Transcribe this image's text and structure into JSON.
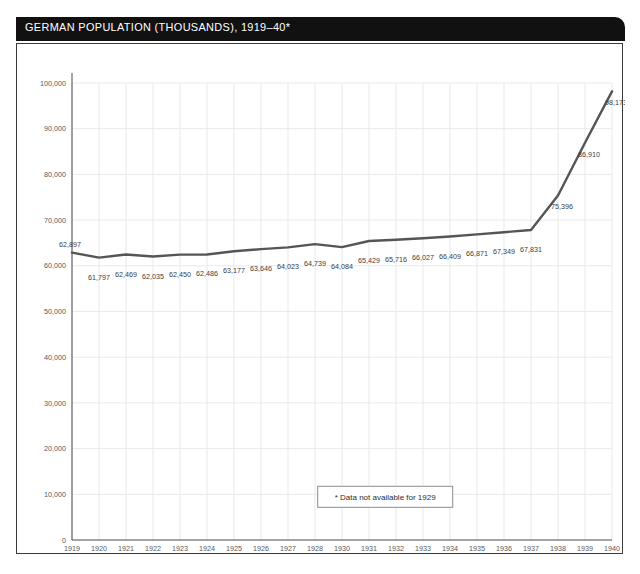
{
  "card": {
    "title": "GERMAN POPULATION (THOUSANDS), 1919–40*"
  },
  "footnote": {
    "text": "* Data not available for 1929"
  },
  "colors": {
    "title_bar_bg": "#111111",
    "title_text": "#ffffff",
    "series_line": "#555555",
    "grid": "#e9e9e9",
    "axis": "#4a4a4a",
    "label_text": "#3d3d3f",
    "tick_text": "#58585a"
  },
  "chart_data": {
    "type": "line",
    "title": "GERMAN POPULATION (THOUSANDS), 1919–40*",
    "xlabel": "",
    "ylabel": "",
    "ylim": [
      0,
      100000
    ],
    "y_ticks": [
      0,
      10000,
      20000,
      30000,
      40000,
      50000,
      60000,
      70000,
      80000,
      90000,
      100000
    ],
    "y_tick_labels": [
      "0",
      "10,000",
      "20,000",
      "30,000",
      "40,000",
      "50,000",
      "60,000",
      "70,000",
      "80,000",
      "90,000",
      "100,000"
    ],
    "grid": true,
    "legend": null,
    "categories": [
      "1919",
      "1920",
      "1921",
      "1922",
      "1923",
      "1924",
      "1925",
      "1926",
      "1927",
      "1928",
      "1930",
      "1931",
      "1932",
      "1933",
      "1934",
      "1935",
      "1936",
      "1937",
      "1938",
      "1939",
      "1940"
    ],
    "values": [
      62897,
      61797,
      62469,
      62035,
      62450,
      62486,
      63177,
      63646,
      64023,
      64739,
      64084,
      65429,
      65716,
      66027,
      66409,
      66871,
      67349,
      67831,
      75396,
      86910,
      98173
    ],
    "point_labels": [
      "62,897",
      "61,797",
      "62,469",
      "62,035",
      "62,450",
      "62,486",
      "63,177",
      "63,646",
      "64,023",
      "64,739",
      "64,084",
      "65,429",
      "65,716",
      "66,027",
      "66,409",
      "66,871",
      "67,349",
      "67,831",
      "75,396",
      "86,910",
      "98,173"
    ],
    "annotations": [
      "* Data not available for 1929"
    ],
    "missing_years": [
      "1929"
    ]
  }
}
